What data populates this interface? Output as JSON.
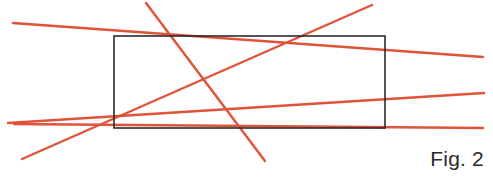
{
  "figure": {
    "caption": "Fig. 2",
    "width": 493,
    "height": 187,
    "background_color": "#ffffff"
  },
  "colors": {
    "line_red": "#e0523a",
    "rectangle_stroke": "#2b2b2b",
    "caption_text": "#2b2b2b"
  },
  "rectangle": {
    "name": "rectangle-outline",
    "x": 114,
    "y": 36,
    "width": 271,
    "height": 92,
    "stroke_width": 1.6,
    "fill": "none"
  },
  "lines": [
    {
      "name": "line-1-upper-left-to-right",
      "x1": 13,
      "y1": 23,
      "x2": 483,
      "y2": 57,
      "stroke_width": 2.4
    },
    {
      "name": "line-2-left-to-lower-right",
      "x1": 14,
      "y1": 124,
      "x2": 483,
      "y2": 128,
      "stroke_width": 2.4
    },
    {
      "name": "line-3-lower-left-to-upper-right",
      "x1": 22,
      "y1": 159,
      "x2": 372,
      "y2": 5,
      "stroke_width": 2.4
    },
    {
      "name": "line-4-steep-descending",
      "x1": 146,
      "y1": 3,
      "x2": 265,
      "y2": 161,
      "stroke_width": 2.4
    },
    {
      "name": "line-5-left-converge-to-right",
      "x1": 8,
      "y1": 123,
      "x2": 484,
      "y2": 93,
      "stroke_width": 2.4
    }
  ]
}
